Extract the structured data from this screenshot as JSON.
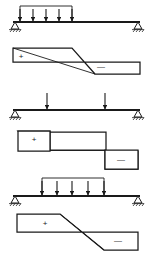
{
  "figure": {
    "background_color": "#ffffff",
    "line_color": "#1a1a1a",
    "width": 150,
    "height": 262
  },
  "cases": [
    {
      "id": "case-1",
      "beam": {
        "x_start": 13,
        "x_end": 140,
        "y": 22,
        "left_support": "pin",
        "right_support": "roller"
      },
      "load": {
        "type": "uniformly-distributed",
        "arrow_count": 5,
        "x_start": 20,
        "x_end": 72,
        "top_y": 6,
        "arrow_positions": [
          20,
          33,
          46,
          59,
          72
        ]
      },
      "shear_diagram": {
        "type": "triangular-crossing",
        "x_start": 13,
        "x_end": 140,
        "baseline_y": 62,
        "positive_label": "+",
        "negative_label": "—",
        "positive_label_x": 21,
        "positive_label_y": 57,
        "negative_label_x": 101,
        "negative_label_y": 67,
        "top_y": 48,
        "bottom_y": 74,
        "zero_crossing_x": 72
      }
    },
    {
      "id": "case-2",
      "beam": {
        "x_start": 13,
        "x_end": 140,
        "y": 110,
        "left_support": "pin",
        "right_support": "roller"
      },
      "load": {
        "type": "point-loads",
        "arrow_count": 2,
        "arrow_positions": [
          47,
          105
        ],
        "top_y": 92
      },
      "shear_diagram": {
        "type": "stepped",
        "x_start": 18,
        "x_end": 138,
        "baseline_y": 150,
        "positive_label": "+",
        "negative_label": "—",
        "positive_label_x": 34,
        "positive_label_y": 139,
        "negative_label_x": 114,
        "negative_label_y": 160,
        "positive_block_x_start": 18,
        "positive_block_x_end": 50,
        "positive_block_top_y": 131,
        "negative_block_x_start": 105,
        "negative_block_x_end": 138,
        "negative_block_bottom_y": 169
      }
    },
    {
      "id": "case-3",
      "beam": {
        "x_start": 13,
        "x_end": 140,
        "y": 196,
        "left_support": "pin",
        "right_support": "roller"
      },
      "load": {
        "type": "partial-uniformly-distributed",
        "arrow_count": 5,
        "x_start": 42,
        "x_end": 104,
        "top_y": 178,
        "arrow_positions": [
          42,
          57,
          72,
          88,
          104
        ]
      },
      "shear_diagram": {
        "type": "trapezoidal-crossing",
        "x_start": 17,
        "x_end": 138,
        "baseline_y": 232,
        "positive_label": "+",
        "negative_label": "—",
        "positive_label_x": 45,
        "positive_label_y": 224,
        "negative_label_x": 113,
        "negative_label_y": 240,
        "top_y": 214,
        "bottom_y": 250,
        "ramp_x_start": 42,
        "ramp_x_end": 104,
        "zero_crossing_x": 73
      }
    }
  ]
}
